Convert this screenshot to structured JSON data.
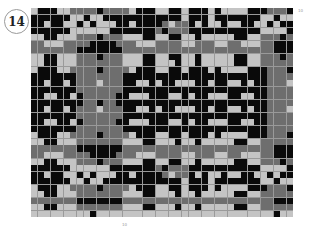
{
  "chart_number": "14",
  "labels": {
    "right_top": "10",
    "bottom": "10"
  },
  "legend": {
    "k": "#0a0a0a",
    "m": "#6e6e6e",
    "l": "#c4c4c4"
  },
  "chart_data": {
    "type": "heatmap",
    "cols": 40,
    "rows": 32,
    "colors": {
      "k": "black",
      "m": "medium gray",
      "l": "light gray"
    },
    "grid": [
      "lkkkllmmmmkmmmmlkkkllkklkkklkllllkkkmmmkm",
      "kkkkkkllkllkkkkkkkkkkkklkkklkkkkkkkllkll",
      "kklkkllklklllkklkkkkmlmmklkllkllkkllklkk",
      "kkkkkkllllllkkkkkkkmkmmmkkkkkkkkkkkllllk",
      "llkklllmmmkmmmlllkkllkkllklllllkkllmmmkm",
      "mmlllmmmmkkkkmmmlllmmmmllmmmllmmlllmmkkk",
      "mmmmmmmkkkkkkkmmmmmmmmmmmmmmmmmmmmmmmkkk",
      "llkklllmmmkmmmlllkkllkkllklllllkkllmmmkm",
      "llkklllmmmmmmmlllkklllkllklllllkkllmmmmm",
      "lkkkllmmmmkmmmmlkkkllkklkkklkllllkkkmmmkm",
      "kkkkkkkmmmmmmmkkkkkkkkkkkkkkkkkkkkkkmmmm",
      "kklkklkmmmlmmmkkllklkklllkklkkllklkkmmml",
      "kkkkkkkmmmmmmmkkkkkkkkkkkkkkkkkkkkkkmmmm",
      "kkllkklkmmmmmkklllkkkllklkklllkkllkkmmmm",
      "kkkkkkkkmmkmmkkkkkkkkkkkkkkkkkkkkkkkmmmm",
      "kklkklkmmmlmmmkkllklkklllkklkkllklkkmmml",
      "kkkkkkkmmmmmmmkkkkkkkkkkkkkkkkkkkkkkmmmm",
      "kkllkklkmmmmmkklllkkkllklkklllkkllkkmmmm",
      "kkkkkkkmmmmmmmkkkkkkkkkkkkkkkkkkkkkkmmmm",
      "lkkkllmmmmkmmmmlkkkllkklkkklkllllkkkmmmkm",
      "llkklllmmmmmmmlllkklllkllklllllkkllmmmmm",
      "mmmmmmmkkkkkkkmmmmmmmmmmmmmmmmmmmmmmmkkk",
      "mmlllmmmmkkkkmmmlllmmmmllmmmllmmlllmmkkk",
      "llkklllmmmkmmmlllkkllkkllklllllkkllmmmkm",
      "kkkkkkllllllkkkkkkkmkmmmkkkkkkkkkkkllllk",
      "kklkkllklklllkklkkkkmlmmklkllkllkkllklkk",
      "kkkkkkllkllkkkkkkkkkkkklkkklkkkkkkkllkll",
      "lkkkllmmmmkmmmmlkkkllkklkkklkllllkkkmmmkm",
      "llkklllmmmmmmmlllkklllkllklllllkkllmmmmm",
      "mmmmmmmkkkkkkkmmmmmmmmmmmmmmmmmmmmmmmkkk",
      "llkklllmmmmmmmlllkklllkllklllllkkllmmmmm",
      "lllllllllklllllllllllllllllllllllllllkll"
    ],
    "xlabel": "",
    "ylabel": "",
    "annotations": [
      "14",
      "10",
      "10"
    ]
  }
}
